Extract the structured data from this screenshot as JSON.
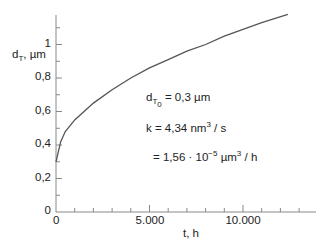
{
  "chart_data": {
    "type": "line",
    "title": "",
    "xlabel": "t, h",
    "ylabel": "d_T, µm",
    "xlim": [
      0,
      13500
    ],
    "ylim": [
      0,
      1.2
    ],
    "x_ticks": [
      "0",
      "5.000",
      "10.000"
    ],
    "y_ticks": [
      "0",
      "0,2",
      "0,4",
      "0,6",
      "0,8",
      "1"
    ],
    "grid": false,
    "series": [
      {
        "name": "d_T(t)",
        "x": [
          0,
          250,
          500,
          1000,
          2000,
          3000,
          4000,
          5000,
          6000,
          7000,
          8000,
          9000,
          10000,
          11000,
          12400
        ],
        "values": [
          0.3,
          0.42,
          0.48,
          0.55,
          0.65,
          0.73,
          0.8,
          0.86,
          0.91,
          0.96,
          1.0,
          1.05,
          1.09,
          1.13,
          1.18
        ]
      }
    ],
    "annotations": [
      "d_T0 = 0,3 µm",
      "k = 4,34 nm³ / s",
      "= 1,56 · 10⁻⁵ µm³ / h"
    ]
  },
  "axes": {
    "ylabel_main": "d",
    "ylabel_sub": "T",
    "ylabel_unit": ", µm",
    "xlabel": "t, h",
    "y_ticks": [
      "0",
      "0,2",
      "0,4",
      "0,6",
      "0,8",
      "1"
    ],
    "x_origin": "0",
    "x_ticks": [
      "5.000",
      "10.000"
    ]
  },
  "annotation": {
    "line1_d": "d",
    "line1_sub": "T",
    "line1_subsub": "0",
    "line1_rest": " = 0,3 µm",
    "line2_a": "k = 4,34 nm",
    "line2_sup": "3",
    "line2_b": " / s",
    "line3_a": "= 1,56 · 10",
    "line3_sup": "−5",
    "line3_b": "  µm",
    "line3_sup2": "3",
    "line3_c": " / h"
  }
}
